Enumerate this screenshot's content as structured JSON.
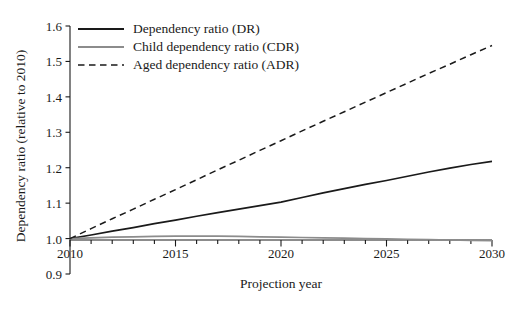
{
  "chart_data": {
    "type": "line",
    "title": "",
    "subtitle": "",
    "xlabel": "Projection year",
    "ylabel": "Dependency ratio (relative to 2010)",
    "xlim": [
      2010,
      2030
    ],
    "ylim": [
      0.9,
      1.6
    ],
    "grid": false,
    "legend_position": "upper left (inside axes)",
    "x_major_ticks": [
      2010,
      2015,
      2020,
      2025,
      2030
    ],
    "x_tick_labels": [
      "2010",
      "2015",
      "2020",
      "2025",
      "2030"
    ],
    "x_minor_tick_step": 1,
    "y_ticks": [
      0.9,
      1.0,
      1.1,
      1.2,
      1.3,
      1.4,
      1.5,
      1.6
    ],
    "y_tick_labels": [
      "0.9",
      "1.0",
      "1.1",
      "1.2",
      "1.3",
      "1.4",
      "1.5",
      "1.6"
    ],
    "x": [
      2010,
      2011,
      2012,
      2013,
      2014,
      2015,
      2016,
      2017,
      2018,
      2019,
      2020,
      2021,
      2022,
      2023,
      2024,
      2025,
      2026,
      2027,
      2028,
      2029,
      2030
    ],
    "series": [
      {
        "name": "Dependency ratio (DR)",
        "abbreviation": "DR",
        "color": "#1a1a1a",
        "style": "solid",
        "values": [
          1.0,
          1.01,
          1.021,
          1.031,
          1.042,
          1.052,
          1.063,
          1.073,
          1.083,
          1.093,
          1.103,
          1.116,
          1.129,
          1.141,
          1.153,
          1.164,
          1.176,
          1.188,
          1.199,
          1.209,
          1.218
        ]
      },
      {
        "name": "Child dependency ratio (CDR)",
        "abbreviation": "CDR",
        "color": "#8c8c8c",
        "style": "solid",
        "values": [
          1.0,
          1.002,
          1.004,
          1.005,
          1.006,
          1.007,
          1.007,
          1.007,
          1.006,
          1.005,
          1.004,
          1.003,
          1.002,
          1.001,
          1.0,
          0.999,
          0.998,
          0.997,
          0.996,
          0.995,
          0.994
        ]
      },
      {
        "name": "Aged dependency ratio (ADR)",
        "abbreviation": "ADR",
        "color": "#1a1a1a",
        "style": "dashed",
        "values": [
          1.0,
          1.028,
          1.056,
          1.083,
          1.111,
          1.138,
          1.166,
          1.194,
          1.221,
          1.249,
          1.276,
          1.304,
          1.331,
          1.358,
          1.385,
          1.412,
          1.439,
          1.466,
          1.492,
          1.519,
          1.545
        ]
      }
    ]
  },
  "legend": {
    "items": [
      {
        "label": "Dependency ratio (DR)"
      },
      {
        "label": "Child dependency ratio (CDR)"
      },
      {
        "label": "Aged dependency ratio (ADR)"
      }
    ]
  },
  "axes": {
    "x_title": "Projection year",
    "y_title": "Dependency ratio (relative to 2010)"
  }
}
